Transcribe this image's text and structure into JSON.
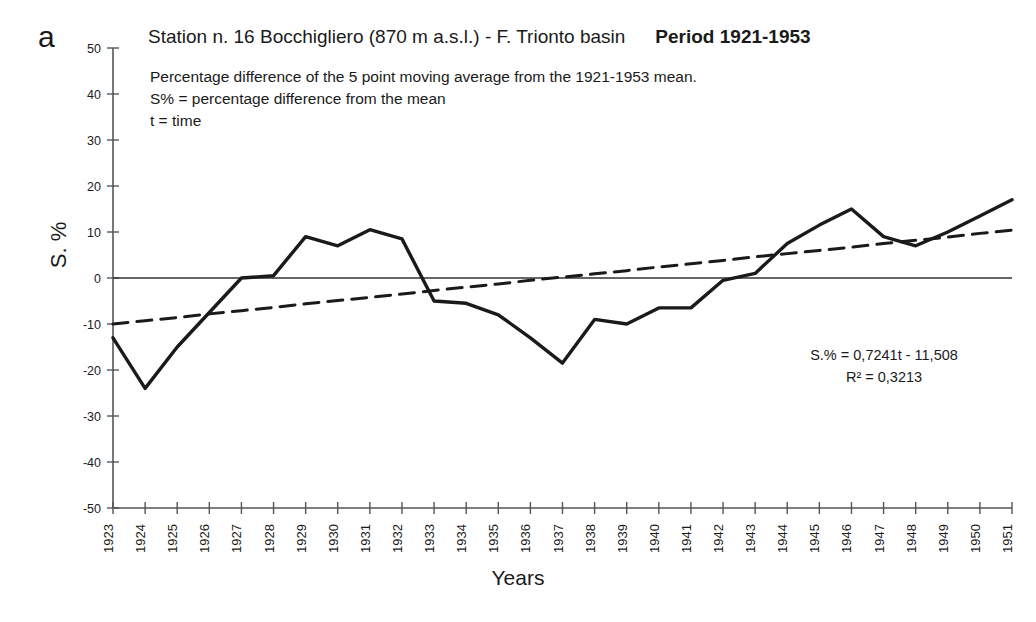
{
  "panel": {
    "letter": "a"
  },
  "header": {
    "title": "Station n. 16 Bocchigliero (870 m a.s.l.) - F. Trionto basin",
    "period": "Period 1921-1953"
  },
  "caption": {
    "line1": "Percentage difference of the 5 point moving average from the 1921-1953 mean.",
    "line2": "S% = percentage difference from the mean",
    "line3": "t = time"
  },
  "annotation": {
    "equation": "S.% = 0,7241t - 11,508",
    "r_squared": "R² = 0,3213"
  },
  "axes": {
    "ylabel": "S. %",
    "xlabel": "Years"
  },
  "colors": {
    "series": "#1a1a1a",
    "trend": "#1a1a1a",
    "axis": "#555555",
    "zero_line": "#333333",
    "background": "#ffffff"
  },
  "chart_data": {
    "type": "line",
    "title": "Station n. 16 Bocchigliero (870 m a.s.l.) - F. Trionto basin",
    "subtitle": "Percentage difference of the 5 point moving average from the 1921-1953 mean.",
    "xlabel": "Years",
    "ylabel": "S. %",
    "xlim": [
      1923,
      1951
    ],
    "ylim": [
      -50,
      50
    ],
    "yticks": [
      50,
      40,
      30,
      20,
      10,
      0,
      -10,
      -20,
      -30,
      -40,
      -50
    ],
    "grid": false,
    "legend": "none",
    "x": [
      1923,
      1924,
      1925,
      1926,
      1927,
      1928,
      1929,
      1930,
      1931,
      1932,
      1933,
      1934,
      1935,
      1936,
      1937,
      1938,
      1939,
      1940,
      1941,
      1942,
      1943,
      1944,
      1945,
      1946,
      1947,
      1948,
      1949,
      1950,
      1951
    ],
    "xticklabels": [
      "1923",
      "1924",
      "1925",
      "1926",
      "1927",
      "1928",
      "1929",
      "1930",
      "1931",
      "1932",
      "1933",
      "1934",
      "1935",
      "1936",
      "1937",
      "1938",
      "1939",
      "1940",
      "1941",
      "1942",
      "1943",
      "1944",
      "1945",
      "1946",
      "1947",
      "1948",
      "1949",
      "1950",
      "1951"
    ],
    "series": [
      {
        "name": "5 point moving average (S%)",
        "style": "solid",
        "values": [
          -13,
          -24,
          -15,
          -7.5,
          0,
          0.5,
          9,
          7,
          10.5,
          8.5,
          -5,
          -5.5,
          -8,
          -13,
          -18.5,
          -9,
          -10,
          -6.5,
          -6.5,
          -0.5,
          1,
          7.5,
          11.5,
          15,
          9,
          7,
          10,
          13.5,
          17
        ]
      },
      {
        "name": "Linear trend (S.% = 0,7241t - 11,508)",
        "style": "dashed",
        "values": [
          -10.0,
          -9.3,
          -8.6,
          -7.8,
          -7.1,
          -6.4,
          -5.6,
          -4.9,
          -4.2,
          -3.5,
          -2.7,
          -2.0,
          -1.3,
          -0.5,
          0.2,
          0.9,
          1.6,
          2.4,
          3.1,
          3.8,
          4.6,
          5.3,
          6.0,
          6.7,
          7.5,
          8.2,
          8.9,
          9.7,
          10.4
        ]
      }
    ],
    "zero_reference_line": 0,
    "annotations": [
      "S.% = 0,7241t - 11,508",
      "R² = 0,3213"
    ]
  }
}
